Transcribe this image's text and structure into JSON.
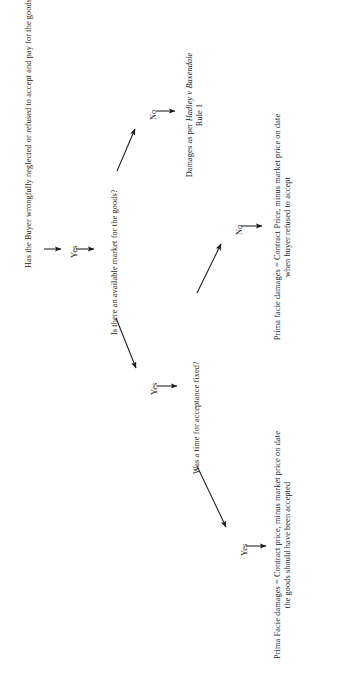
{
  "diagram": {
    "orientation": "rotated-90-ccw",
    "background_color": "#ffffff",
    "ink_color": "#1b1b1b",
    "nodes": {
      "q1": "Has the Buyer wrongfully neglected or refused to accept and pay for the goods?",
      "q2": "Is there an available market for the goods?",
      "q3": "Was a time for acceptance fixed?",
      "outcome_hadley_line1_pre": "Damages as per ",
      "outcome_hadley_case": "Hadley v Baxendale",
      "outcome_hadley_line2": "Rule 1",
      "outcome_no_time": "Prima facie damages  =  Contract Price, minus market price on date when buyer refused to accept",
      "outcome_yes_time": "Prima Facie damages  =  Contract price, minus market price on date the goods should have been accepted"
    },
    "labels": {
      "q1_yes": "Yes",
      "q2_no": "No",
      "q2_yes": "Yes",
      "q3_no": "No",
      "q3_yes": "Yes"
    },
    "edges": [
      {
        "name": "q1-to-yes",
        "from": "q1",
        "to": "q1_yes",
        "kind": "straight"
      },
      {
        "name": "yes-to-q2",
        "from": "q1_yes",
        "to": "q2",
        "kind": "straight"
      },
      {
        "name": "q2-to-no",
        "from": "q2",
        "to": "q2_no",
        "kind": "diagonal"
      },
      {
        "name": "no-to-hadley",
        "from": "q2_no",
        "to": "outcome_hadley",
        "kind": "straight"
      },
      {
        "name": "q2-to-yes",
        "from": "q2",
        "to": "q2_yes",
        "kind": "diagonal"
      },
      {
        "name": "yes-to-q3",
        "from": "q2_yes",
        "to": "q3",
        "kind": "straight"
      },
      {
        "name": "q3-to-no",
        "from": "q3",
        "to": "q3_no",
        "kind": "diagonal"
      },
      {
        "name": "no-to-outcome",
        "from": "q3_no",
        "to": "outcome_no_time",
        "kind": "straight"
      },
      {
        "name": "q3-to-yes",
        "from": "q3",
        "to": "q3_yes",
        "kind": "diagonal"
      },
      {
        "name": "yes-to-outcome",
        "from": "q3_yes",
        "to": "outcome_yes_time",
        "kind": "straight"
      }
    ]
  }
}
